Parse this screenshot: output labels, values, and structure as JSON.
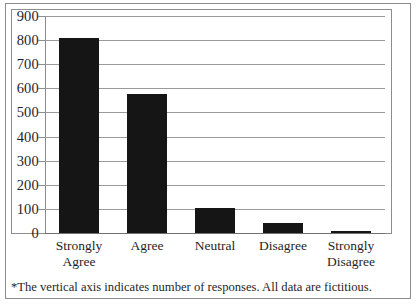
{
  "chart_data": {
    "type": "bar",
    "title": "",
    "xlabel": "",
    "ylabel": "",
    "categories": [
      "Strongly Agree",
      "Agree",
      "Neutral",
      "Disagree",
      "Strongly Disagree"
    ],
    "category_lines": [
      [
        "Strongly",
        "Agree"
      ],
      [
        "Agree",
        ""
      ],
      [
        "Neutral",
        ""
      ],
      [
        "Disagree",
        ""
      ],
      [
        "Strongly",
        "Disagree"
      ]
    ],
    "values": [
      810,
      575,
      105,
      40,
      10
    ],
    "ylim": [
      0,
      900
    ],
    "ytick_step": 100,
    "yticks": [
      "900",
      "800",
      "700",
      "600",
      "500",
      "400",
      "300",
      "200",
      "100",
      "0"
    ],
    "grid": true,
    "legend": "none",
    "bar_color": "#151515",
    "gridline_color": "#9a9a9a",
    "axis_color": "#8d8d8d",
    "background_color": "#ffffff"
  },
  "footnote": {
    "text": "*The vertical axis indicates number of responses. All data are fictitious."
  }
}
